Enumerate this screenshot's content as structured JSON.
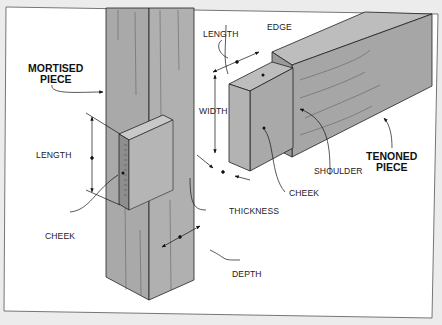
{
  "diagram": {
    "type": "mortise-and-tenon joint illustration",
    "colors": {
      "background": "#ececec",
      "panel": "#ffffff",
      "wood": "#a9a9a9",
      "wood_light": "#bdbdbd",
      "wood_dark": "#8e8e8e",
      "line": "#222222"
    },
    "labels": {
      "mortised_piece_line1": "MORTISED",
      "mortised_piece_line2": "PIECE",
      "tenoned_piece_line1": "TENONED",
      "tenoned_piece_line2": "PIECE",
      "mortise_length": "LENGTH",
      "mortise_cheek": "CHEEK",
      "depth": "DEPTH",
      "tenon_length": "LENGTH",
      "edge": "EDGE",
      "width": "WIDTH",
      "shoulder": "SHOULDER",
      "tenon_cheek": "CHEEK",
      "thickness": "THICKNESS"
    }
  }
}
